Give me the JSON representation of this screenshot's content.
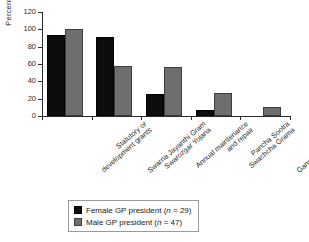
{
  "chart_data": {
    "type": "bar",
    "title": "",
    "xlabel": "",
    "ylabel": "Percent",
    "ylim": [
      0,
      120
    ],
    "yticks": [
      0,
      20,
      40,
      60,
      80,
      100,
      120
    ],
    "grid": false,
    "legend_position": "bottom",
    "categories": [
      "Statutory or development grants",
      "Swarna Jayanthi Gram Swarozgar Yojana",
      "Annual maintenance and repair",
      "Pancha Sootra Swachcha Grama",
      "Ganga Kalyana Yojana"
    ],
    "category_lines": [
      [
        "Statutory or",
        "development grants"
      ],
      [
        "Swarna Jayanthi Gram",
        "Swarozgar Yojana"
      ],
      [
        "Annual maintenance",
        "and repair"
      ],
      [
        "Pancha Sootra",
        "Swachcha Grama"
      ],
      [
        "Ganga Kalyana Yojana"
      ]
    ],
    "series": [
      {
        "name": "Female GP president (n = 29)",
        "short_name": "Female GP president",
        "n": 29,
        "color": "#0d0d0d",
        "values": [
          93,
          91,
          25,
          7,
          0
        ]
      },
      {
        "name": "Male GP president (n = 47)",
        "short_name": "Male GP president",
        "n": 47,
        "color": "#6e6e6e",
        "values": [
          100,
          58,
          57,
          26,
          10
        ]
      }
    ]
  },
  "legend": {
    "items": [
      {
        "label_before": "Female GP president (",
        "italic": "n",
        "label_after": " = 29)"
      },
      {
        "label_before": "Male GP president (",
        "italic": "n",
        "label_after": " = 47)"
      }
    ]
  },
  "axis": {
    "y_label": "Percent",
    "y_tick_labels": [
      "0",
      "20",
      "40",
      "60",
      "80",
      "100",
      "120"
    ]
  }
}
